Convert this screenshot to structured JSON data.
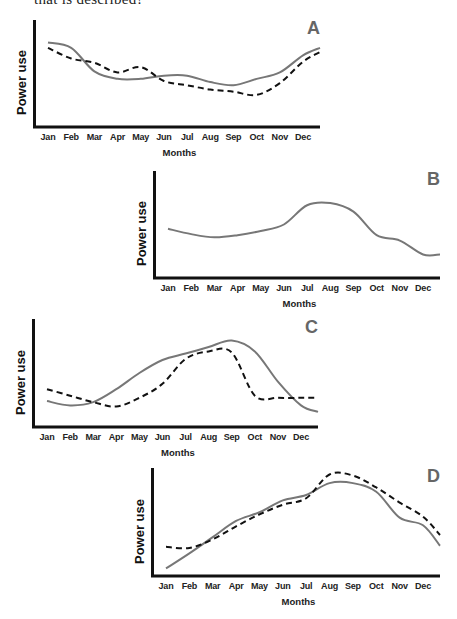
{
  "header": {
    "text": "that is described?"
  },
  "chart_data": [
    {
      "id": "A",
      "type": "line",
      "title": "A",
      "xlabel": "Months",
      "ylabel": "Power use",
      "categories": [
        "Jan",
        "Feb",
        "Mar",
        "Apr",
        "May",
        "Jun",
        "Jul",
        "Aug",
        "Sep",
        "Oct",
        "Nov",
        "Dec"
      ],
      "grid": false,
      "legend": null,
      "ylim": [
        0,
        100
      ],
      "series": [
        {
          "name": "solid",
          "style": "solid",
          "color": "#777777",
          "values": [
            79,
            74,
            52,
            45,
            45,
            48,
            48,
            42,
            39,
            45,
            51,
            67
          ],
          "end": 74
        },
        {
          "name": "dashed",
          "style": "dashed",
          "color": "#111111",
          "values": [
            74,
            64,
            60,
            51,
            56,
            43,
            39,
            35,
            33,
            30,
            41,
            61
          ],
          "end": 70
        }
      ]
    },
    {
      "id": "B",
      "type": "line",
      "title": "B",
      "xlabel": "Months",
      "ylabel": "Power use",
      "categories": [
        "Jan",
        "Feb",
        "Mar",
        "Apr",
        "May",
        "Jun",
        "Jul",
        "Aug",
        "Sep",
        "Oct",
        "Nov",
        "Dec"
      ],
      "grid": false,
      "legend": null,
      "ylim": [
        0,
        100
      ],
      "series": [
        {
          "name": "solid",
          "style": "solid",
          "color": "#777777",
          "values": [
            46,
            41,
            38,
            40,
            44,
            50,
            68,
            70,
            62,
            40,
            35,
            22
          ],
          "end": 22
        }
      ]
    },
    {
      "id": "C",
      "type": "line",
      "title": "C",
      "xlabel": "Months",
      "ylabel": "Power use",
      "categories": [
        "Jan",
        "Feb",
        "Mar",
        "Apr",
        "May",
        "Jun",
        "Jul",
        "Aug",
        "Sep",
        "Oct",
        "Nov",
        "Dec"
      ],
      "grid": false,
      "legend": null,
      "ylim": [
        0,
        100
      ],
      "series": [
        {
          "name": "solid",
          "style": "solid",
          "color": "#777777",
          "values": [
            24,
            20,
            23,
            35,
            50,
            62,
            68,
            74,
            80,
            70,
            42,
            20
          ],
          "end": 14
        },
        {
          "name": "dashed",
          "style": "dashed",
          "color": "#111111",
          "values": [
            35,
            29,
            23,
            19,
            27,
            40,
            63,
            70,
            69,
            29,
            27,
            27
          ],
          "end": 27
        }
      ]
    },
    {
      "id": "D",
      "type": "line",
      "title": "D",
      "xlabel": "Months",
      "ylabel": "Power use",
      "categories": [
        "Jan",
        "Feb",
        "Mar",
        "Apr",
        "May",
        "Jun",
        "Jul",
        "Aug",
        "Sep",
        "Oct",
        "Nov",
        "Dec"
      ],
      "grid": false,
      "legend": null,
      "ylim": [
        0,
        100
      ],
      "series": [
        {
          "name": "solid",
          "style": "solid",
          "color": "#777777",
          "values": [
            7,
            21,
            36,
            51,
            59,
            70,
            75,
            86,
            86,
            78,
            54,
            47
          ],
          "end": 28
        },
        {
          "name": "dashed",
          "style": "dashed",
          "color": "#111111",
          "values": [
            27,
            26,
            34,
            46,
            57,
            66,
            72,
            94,
            93,
            82,
            68,
            55
          ],
          "end": 38
        }
      ]
    }
  ],
  "charts_layout": [
    {
      "id": "A",
      "left": 33,
      "top": 20,
      "width": 287,
      "height": 107
    },
    {
      "id": "B",
      "left": 153,
      "top": 171,
      "width": 287,
      "height": 107
    },
    {
      "id": "C",
      "left": 32,
      "top": 319,
      "width": 286,
      "height": 108
    },
    {
      "id": "D",
      "left": 151,
      "top": 468,
      "width": 289,
      "height": 108
    }
  ]
}
